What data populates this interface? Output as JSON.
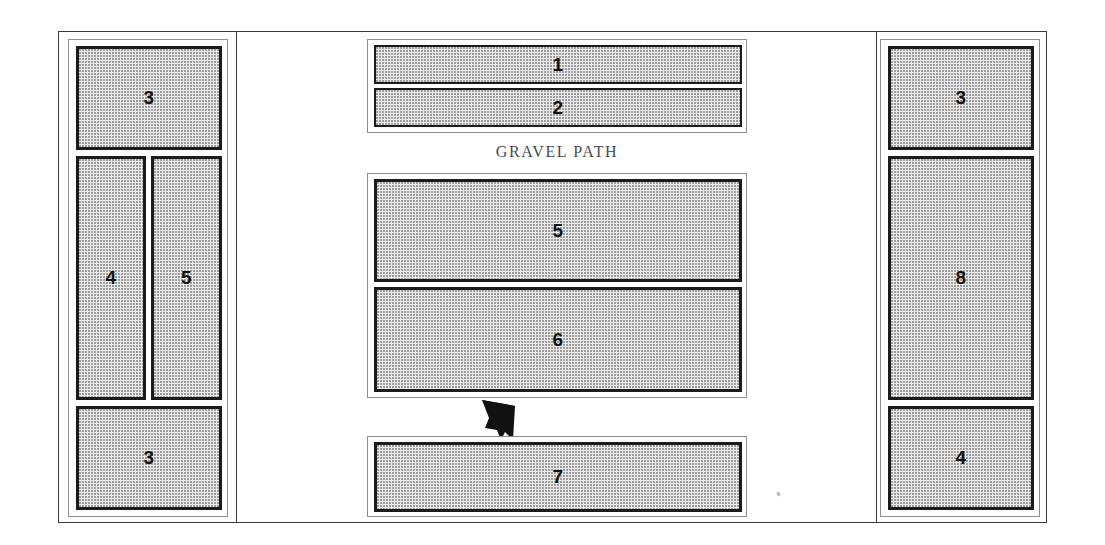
{
  "plan": {
    "title": "Garden Bed Planting Plan",
    "path_label": "GRAVEL PATH",
    "arrow": {
      "name": "direction-arrow",
      "points_to": "up-left",
      "color": "#111111"
    },
    "colors": {
      "bed_fill": "#ebebeb",
      "bed_stipple": "#9a9a9a",
      "bed_border": "#1b1b1b",
      "frame_border": "#3a3a3a",
      "group_border": "#8d8d8d",
      "label_text": "#4a4a4a",
      "background": "#ffffff"
    },
    "zones": [
      {
        "name": "left-zone",
        "beds": [
          {
            "id": "left-bed-top",
            "label": "3"
          },
          {
            "id": "left-bed-middle-left",
            "label": "4"
          },
          {
            "id": "left-bed-middle-right",
            "label": "5"
          },
          {
            "id": "left-bed-bottom",
            "label": "3"
          }
        ]
      },
      {
        "name": "center-zone",
        "beds": [
          {
            "id": "center-bed-1",
            "label": "1"
          },
          {
            "id": "center-bed-2",
            "label": "2"
          },
          {
            "id": "center-bed-5",
            "label": "5"
          },
          {
            "id": "center-bed-6",
            "label": "6"
          },
          {
            "id": "center-bed-7",
            "label": "7"
          }
        ]
      },
      {
        "name": "right-zone",
        "beds": [
          {
            "id": "right-bed-top",
            "label": "3"
          },
          {
            "id": "right-bed-middle",
            "label": "8"
          },
          {
            "id": "right-bed-bottom",
            "label": "4"
          }
        ]
      }
    ]
  }
}
